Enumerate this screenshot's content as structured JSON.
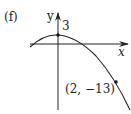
{
  "panel_label": "(f)",
  "axes": {
    "x_label": "x",
    "y_label": "y"
  },
  "annotations": {
    "y_intercept_label": "3",
    "point_label": "(2, −13)"
  },
  "curve": {
    "type": "downward parabola",
    "y_intercept": 3,
    "marked_point": [
      2,
      -13
    ]
  },
  "colors": {
    "stroke": "#222222",
    "background": "#ffffff"
  }
}
